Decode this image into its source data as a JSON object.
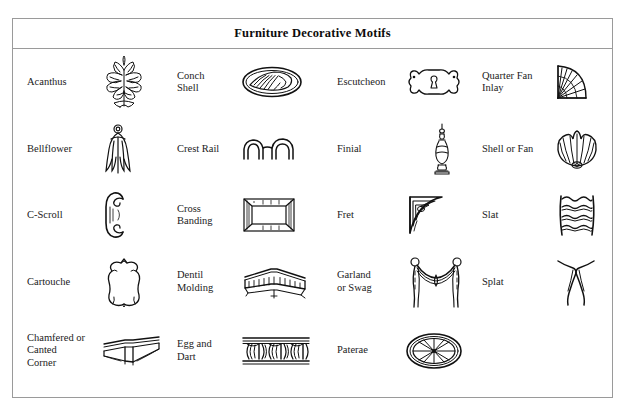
{
  "header": {
    "title": "Furniture Decorative Motifs"
  },
  "colors": {
    "border": "#9a9a9a",
    "text": "#1b1b1b",
    "ink": "#111111",
    "background": "#ffffff"
  },
  "table": {
    "columns": 4,
    "rows": [
      [
        {
          "label": "Acanthus",
          "icon": "acanthus-leaf-icon"
        },
        {
          "label": "Conch\nShell",
          "icon": "conch-shell-icon"
        },
        {
          "label": "Escutcheon",
          "icon": "escutcheon-keyhole-plate-icon"
        },
        {
          "label": "Quarter Fan\nInlay",
          "icon": "quarter-fan-inlay-icon"
        }
      ],
      [
        {
          "label": "Bellflower",
          "icon": "bellflower-icon"
        },
        {
          "label": "Crest Rail",
          "icon": "crest-rail-icon"
        },
        {
          "label": "Finial",
          "icon": "finial-icon"
        },
        {
          "label": "Shell or Fan",
          "icon": "shell-or-fan-icon"
        }
      ],
      [
        {
          "label": "C-Scroll",
          "icon": "c-scroll-icon"
        },
        {
          "label": "Cross\nBanding",
          "icon": "cross-banding-icon"
        },
        {
          "label": "Fret",
          "icon": "fret-bracket-icon"
        },
        {
          "label": "Slat",
          "icon": "slat-ladderback-icon"
        }
      ],
      [
        {
          "label": "Cartouche",
          "icon": "cartouche-icon"
        },
        {
          "label": "Dentil\nMolding",
          "icon": "dentil-molding-icon"
        },
        {
          "label": "Garland\nor Swag",
          "icon": "garland-swag-icon"
        },
        {
          "label": "Splat",
          "icon": "splat-icon"
        }
      ],
      [
        {
          "label": "Chamfered or\nCanted\nCorner",
          "icon": "chamfered-canted-corner-icon"
        },
        {
          "label": "Egg and\nDart",
          "icon": "egg-and-dart-icon"
        },
        {
          "label": "Paterae",
          "icon": "paterae-rosette-icon"
        },
        {
          "label": "",
          "icon": ""
        }
      ]
    ]
  }
}
